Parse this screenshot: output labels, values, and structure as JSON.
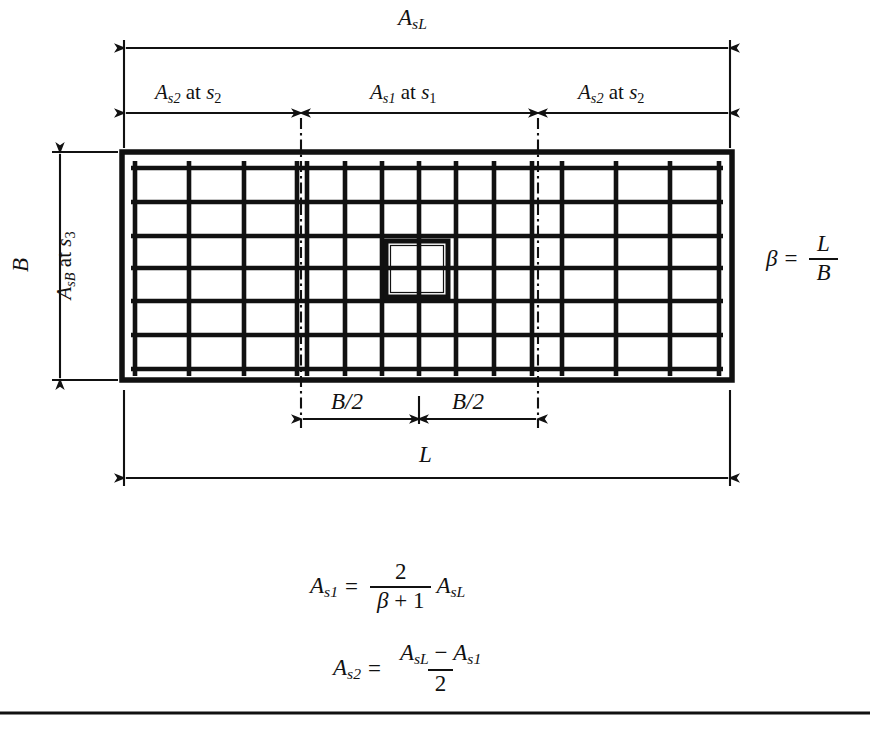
{
  "figure": {
    "type": "structural-detail",
    "background_color": "#ffffff",
    "line_color": "#111111"
  },
  "dimensions": {
    "top_overall": {
      "label": "A_sL",
      "base": "A",
      "sub": "sL"
    },
    "top_zone_left": {
      "base": "A",
      "sub": "s2",
      "connector": "at",
      "spacing_base": "s",
      "spacing_sub": "2"
    },
    "top_zone_center": {
      "base": "A",
      "sub": "s1",
      "connector": "at",
      "spacing_base": "s",
      "spacing_sub": "1"
    },
    "top_zone_right": {
      "base": "A",
      "sub": "s2",
      "connector": "at",
      "spacing_base": "s",
      "spacing_sub": "2"
    },
    "left_width": {
      "label": "B"
    },
    "left_rebar": {
      "base": "A",
      "sub": "sB",
      "connector": "at",
      "spacing_base": "s",
      "spacing_sub": "3"
    },
    "bottom_half_left": {
      "label": "B/2"
    },
    "bottom_half_right": {
      "label": "B/2"
    },
    "bottom_overall": {
      "label": "L"
    }
  },
  "beta_formula": {
    "lhs": "β",
    "eq": "=",
    "numerator": "L",
    "denominator": "B"
  },
  "formulas": [
    {
      "id": "as1",
      "lhs_base": "A",
      "lhs_sub": "s1",
      "eq": "=",
      "numerator": "2",
      "denominator_beta": "β",
      "denominator_plus": "+",
      "denominator_one": "1",
      "trailing_base": "A",
      "trailing_sub": "sL"
    },
    {
      "id": "as2",
      "lhs_base": "A",
      "lhs_sub": "s2",
      "eq": "=",
      "num_left_base": "A",
      "num_left_sub": "sL",
      "num_minus": "−",
      "num_right_base": "A",
      "num_right_sub": "s1",
      "denominator": "2"
    }
  ],
  "footing": {
    "outline": {
      "x": 122,
      "y": 152,
      "width": 610,
      "height": 228
    },
    "column": {
      "x": 386,
      "y": 241,
      "width": 62,
      "height": 56
    },
    "zone_divider_left_x": 301,
    "zone_divider_right_x": 538,
    "horizontal_bars_count": 7,
    "long_bars_left_zone_count": 4,
    "long_bars_center_zone_count": 7,
    "long_bars_right_zone_count": 4
  }
}
